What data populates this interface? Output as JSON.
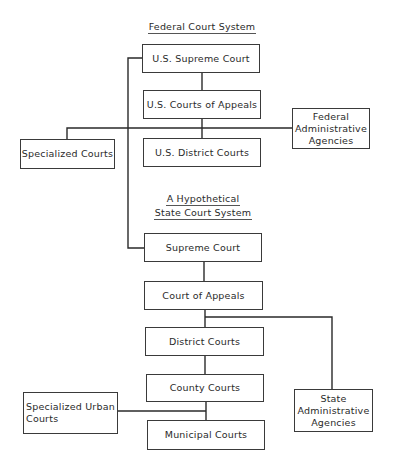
{
  "federal": {
    "title": "Federal Court System",
    "supreme": "U.S. Supreme Court",
    "appeals": "U.S. Courts of Appeals",
    "district": "U.S. District Courts",
    "specialized": "Specialized Courts",
    "admin": "Federal\nAdministrative\nAgencies"
  },
  "state": {
    "title_line1": "A Hypothetical",
    "title_line2": "State Court System",
    "supreme": "Supreme Court",
    "appeals": "Court of Appeals",
    "district": "District Courts",
    "county": "County Courts",
    "municipal": "Municipal Courts",
    "specialized_urban": "Specialized Urban\n      Courts",
    "admin": "State\nAdministrative\nAgencies"
  }
}
